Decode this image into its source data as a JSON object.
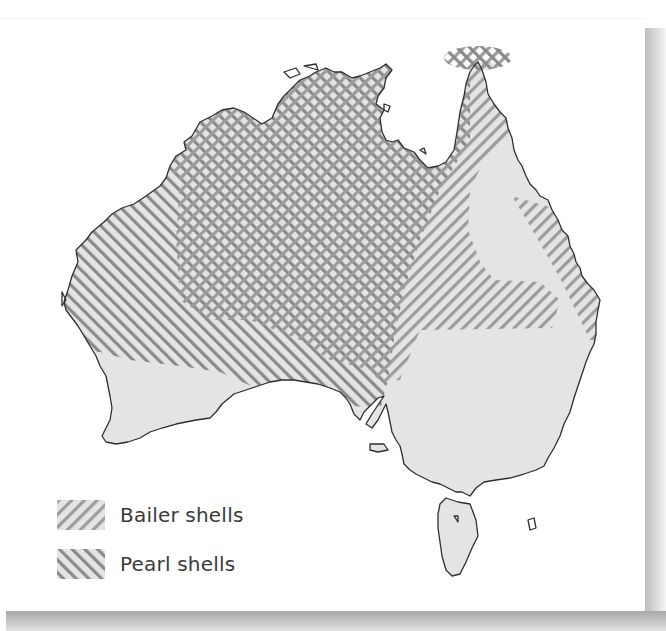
{
  "map": {
    "subject": "Australia",
    "colors": {
      "land": "#e4e4e4",
      "coastline": "#2e2e2e",
      "hatch": "#8f8f8f",
      "bailer_hatch": "#a6a6a6",
      "pearl_hatch": "#8a8a8a"
    },
    "regions": [
      {
        "name": "Bailer shells",
        "pattern": "diagonal-forward"
      },
      {
        "name": "Pearl shells",
        "pattern": "diagonal-back"
      }
    ]
  },
  "legend": {
    "items": [
      {
        "label": "Bailer shells",
        "pattern": "bailer",
        "icon": "hatch-forward-swatch"
      },
      {
        "label": "Pearl shells",
        "pattern": "pearl",
        "icon": "hatch-back-swatch"
      }
    ]
  }
}
